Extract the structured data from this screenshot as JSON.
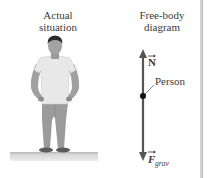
{
  "panels": {
    "actual": {
      "title_line1": "Actual",
      "title_line2": "situation"
    },
    "free_body": {
      "title_line1": "Free-body",
      "title_line2": "diagram"
    }
  },
  "diagram": {
    "normal_force_label": "N",
    "gravity_force_label": "F",
    "gravity_subscript": "grav",
    "object_label": "Person"
  },
  "colors": {
    "arrow": "#555555",
    "dot": "#111111",
    "shirt": "#e6e6e6",
    "skin": "#9a9a9a",
    "hair": "#2b2b2b",
    "pants": "#9b9b9b",
    "shoes": "#555555",
    "ground_top": "#d0d0d0",
    "ground_bottom": "#e8e8e8"
  }
}
